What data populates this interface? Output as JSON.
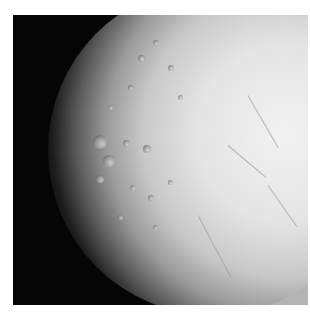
{
  "image": {
    "subject": "cratered icy moon surface",
    "alt": "Grayscale photograph of an icy moon, heavily cratered on the left shadowed side and smooth with fractures on the brightly lit right side",
    "colors": {
      "space": "#050505",
      "surface_bright": "#f2f2f2",
      "surface_mid": "#c8c8c8",
      "corner_fill": "#b4b4b4",
      "page_bg": "#ffffff"
    }
  }
}
